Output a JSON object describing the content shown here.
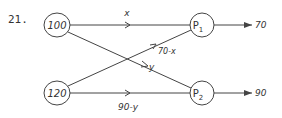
{
  "problem_number": "21.",
  "nodes": {
    "source_top": {
      "label": "100"
    },
    "source_bottom": {
      "label": "120"
    },
    "dest_top": {
      "label": "P",
      "subscript": "1"
    },
    "dest_bottom": {
      "label": "P",
      "subscript": "2"
    }
  },
  "edges": {
    "top_to_p1": {
      "label": "x"
    },
    "top_to_p2": {
      "label": "y"
    },
    "bottom_to_p1": {
      "label": "70-x"
    },
    "bottom_to_p2": {
      "label": "90-y"
    }
  },
  "outputs": {
    "p1": {
      "label": "70"
    },
    "p2": {
      "label": "90"
    }
  },
  "colors": {
    "stroke": "#444444",
    "text": "#333333"
  }
}
